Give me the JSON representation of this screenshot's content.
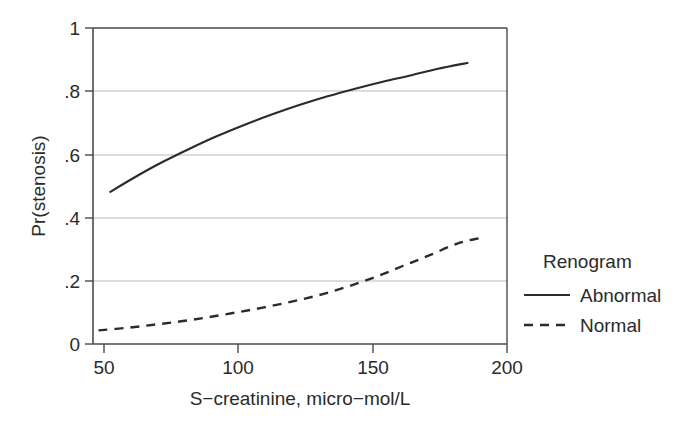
{
  "chart_data": {
    "type": "line",
    "title": "",
    "xlabel": "S−creatinine, micro−mol/L",
    "ylabel": "Pr(stenosis)",
    "xlim": [
      50,
      200
    ],
    "ylim": [
      0,
      1
    ],
    "xticks": [
      50,
      100,
      150,
      200
    ],
    "xtick_labels": [
      "50",
      "100",
      "150",
      "200"
    ],
    "yticks": [
      0,
      0.2,
      0.4,
      0.6,
      0.8,
      1
    ],
    "ytick_labels": [
      "0",
      ".2",
      ".4",
      ".6",
      ".8",
      "1"
    ],
    "grid": "horizontal",
    "legend_position": "right",
    "legend_title": "Renogram",
    "series": [
      {
        "name": "Abnormal",
        "style": "solid",
        "color": "#2b2b2b",
        "x": [
          56,
          65,
          75,
          85,
          95,
          105,
          115,
          125,
          135,
          145,
          155,
          165,
          175,
          186
        ],
        "values": [
          0.48,
          0.527,
          0.575,
          0.618,
          0.658,
          0.694,
          0.727,
          0.757,
          0.784,
          0.808,
          0.83,
          0.85,
          0.871,
          0.89
        ]
      },
      {
        "name": "Normal",
        "style": "dashed",
        "color": "#2b2b2b",
        "x": [
          52,
          62,
          72,
          82,
          92,
          102,
          112,
          122,
          132,
          142,
          152,
          162,
          172,
          182,
          190
        ],
        "values": [
          0.043,
          0.051,
          0.061,
          0.072,
          0.085,
          0.1,
          0.116,
          0.134,
          0.155,
          0.181,
          0.211,
          0.246,
          0.281,
          0.318,
          0.335
        ]
      }
    ]
  },
  "axes": {
    "y_label": "Pr(stenosis)",
    "x_label": "S−creatinine, micro−mol/L"
  },
  "legend": {
    "title": "Renogram",
    "entries": [
      {
        "label": "Abnormal",
        "style": "solid"
      },
      {
        "label": "Normal",
        "style": "dashed"
      }
    ]
  },
  "colors": {
    "line": "#2b2b2b",
    "grid": "#b9b9b9",
    "frame": "#4a4a4a",
    "text": "#2b2b2b",
    "background": "#ffffff"
  }
}
